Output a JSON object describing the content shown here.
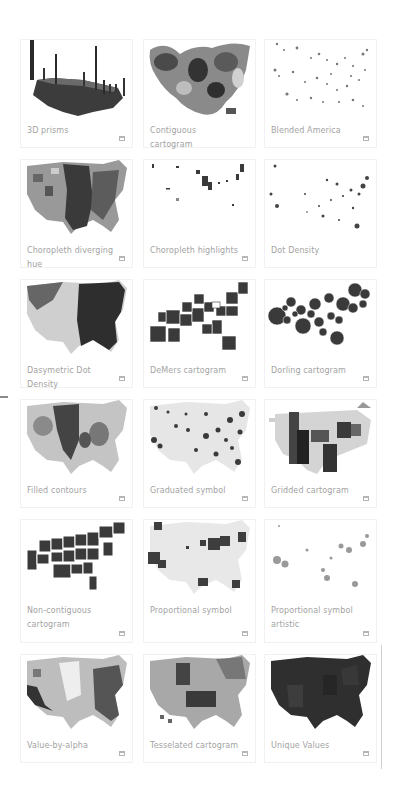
{
  "gallery": {
    "cards": [
      {
        "label": "3D prisms",
        "thumbnail": "3d-prisms-map",
        "has_icon": true
      },
      {
        "label": "Contiguous cartogram",
        "thumbnail": "contiguous-cartogram-map",
        "has_icon": false
      },
      {
        "label": "Blended America",
        "thumbnail": "blended-america-map",
        "has_icon": true
      },
      {
        "label": "Choropleth diverging hue",
        "thumbnail": "choropleth-diverging-map",
        "has_icon": true
      },
      {
        "label": "Choropleth highlights",
        "thumbnail": "choropleth-highlights-map",
        "has_icon": true
      },
      {
        "label": "Dot Density",
        "thumbnail": "dot-density-map",
        "has_icon": false
      },
      {
        "label": "Dasymetric Dot Density",
        "thumbnail": "dasymetric-dot-density-map",
        "has_icon": true
      },
      {
        "label": "DeMers cartogram",
        "thumbnail": "demers-cartogram-map",
        "has_icon": true
      },
      {
        "label": "Dorling cartogram",
        "thumbnail": "dorling-cartogram-map",
        "has_icon": true
      },
      {
        "label": "Filled contours",
        "thumbnail": "filled-contours-map",
        "has_icon": true
      },
      {
        "label": "Graduated symbol",
        "thumbnail": "graduated-symbol-map",
        "has_icon": true
      },
      {
        "label": "Gridded cartogram",
        "thumbnail": "gridded-cartogram-map",
        "has_icon": true
      },
      {
        "label": "Non-contiguous cartogram",
        "thumbnail": "non-contiguous-cartogram-map",
        "has_icon": true
      },
      {
        "label": "Proportional symbol",
        "thumbnail": "proportional-symbol-map",
        "has_icon": true
      },
      {
        "label": "Proportional symbol artistic",
        "thumbnail": "proportional-symbol-artistic-map",
        "has_icon": true
      },
      {
        "label": "Value-by-alpha",
        "thumbnail": "value-by-alpha-map",
        "has_icon": true
      },
      {
        "label": "Tesselated cartogram",
        "thumbnail": "tesselated-cartogram-map",
        "has_icon": true
      },
      {
        "label": "Unique Values",
        "thumbnail": "unique-values-map",
        "has_icon": true
      }
    ],
    "corner_icon": "window-icon"
  },
  "colors": {
    "label_text": "#a3a3a3",
    "card_border": "#f1f1f1",
    "map_dark": "#2e2e2e",
    "map_mid": "#777777",
    "map_light": "#c8c8c8"
  }
}
